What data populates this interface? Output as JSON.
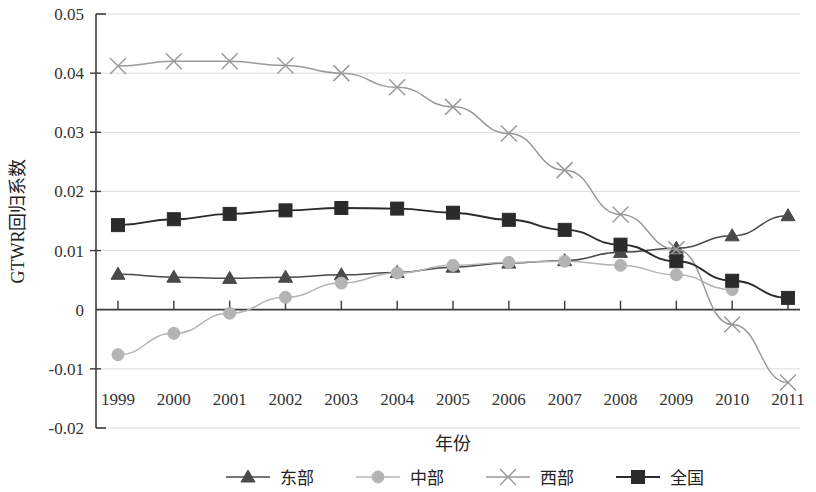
{
  "chart_data": {
    "type": "line",
    "title": "",
    "xlabel": "年份",
    "ylabel": "GTWR回归系数",
    "x": [
      1999,
      2000,
      2001,
      2002,
      2003,
      2004,
      2005,
      2006,
      2007,
      2008,
      2009,
      2010,
      2011
    ],
    "categories": [
      "1999",
      "2000",
      "2001",
      "2002",
      "2003",
      "2004",
      "2005",
      "2006",
      "2007",
      "2008",
      "2009",
      "2010",
      "2011"
    ],
    "ylim": [
      -0.02,
      0.05
    ],
    "yticks": [
      0.05,
      0.04,
      0.03,
      0.02,
      0.01,
      0,
      -0.01,
      -0.02
    ],
    "ytick_labels": [
      "0.05",
      "0.04",
      "0.03",
      "0.02",
      "0.01",
      "0",
      "-0.01",
      "-0.02"
    ],
    "grid": true,
    "legend_position": "bottom",
    "series": [
      {
        "name": "东部",
        "marker": "triangle",
        "color": "#4a4a4a",
        "values": [
          0.006,
          0.0055,
          0.0053,
          0.0055,
          0.0059,
          0.0063,
          0.0072,
          0.0079,
          0.0083,
          0.0097,
          0.0104,
          0.0125,
          0.0159
        ]
      },
      {
        "name": "中部",
        "marker": "circle",
        "color": "#b4b4b4",
        "values": [
          -0.0076,
          -0.004,
          -0.0006,
          0.0021,
          0.0045,
          0.0062,
          0.0075,
          0.008,
          0.0082,
          0.0075,
          0.0059,
          0.0034,
          null
        ]
      },
      {
        "name": "西部",
        "marker": "cross",
        "color": "#9a9a9a",
        "values": [
          0.0412,
          0.042,
          0.042,
          0.0413,
          0.04,
          0.0376,
          0.0343,
          0.0298,
          0.0236,
          0.0161,
          0.0102,
          -0.0025,
          -0.0123
        ]
      },
      {
        "name": "全国",
        "marker": "square",
        "color": "#2b2b2b",
        "values": [
          0.0143,
          0.0153,
          0.0162,
          0.0168,
          0.0172,
          0.0171,
          0.0164,
          0.0152,
          0.0135,
          0.011,
          0.0082,
          0.0049,
          0.002
        ]
      }
    ]
  },
  "legend": {
    "items": [
      {
        "label": "东部",
        "marker": "triangle",
        "color": "#4a4a4a"
      },
      {
        "label": "中部",
        "marker": "circle",
        "color": "#b4b4b4"
      },
      {
        "label": "西部",
        "marker": "cross",
        "color": "#9a9a9a"
      },
      {
        "label": "全国",
        "marker": "square",
        "color": "#2b2b2b"
      }
    ]
  },
  "axes": {
    "y_title": "GTWR回归系数",
    "x_title": "年份"
  }
}
